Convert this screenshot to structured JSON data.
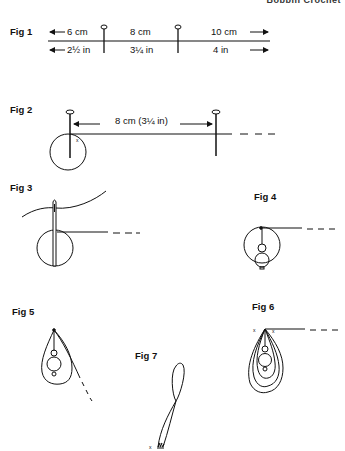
{
  "header": {
    "text": "Bobbin Crochet"
  },
  "figures": [
    {
      "label": "Fig 1",
      "top_labels": {
        "left": "6 cm",
        "middle": "8 cm",
        "right": "10 cm"
      },
      "bottom_labels": {
        "left": "2½ in",
        "middle": "3¼ in",
        "right": "4 in"
      },
      "pins": 2
    },
    {
      "label": "Fig 2",
      "dimension": "8 cm (3¼ in)",
      "mark": "x"
    },
    {
      "label": "Fig 3"
    },
    {
      "label": "Fig 4"
    },
    {
      "label": "Fig 5"
    },
    {
      "label": "Fig 6",
      "marks": [
        "x",
        "x"
      ]
    },
    {
      "label": "Fig 7",
      "mark": "x"
    }
  ],
  "colors": {
    "ink": "#111111",
    "background": "#ffffff"
  }
}
